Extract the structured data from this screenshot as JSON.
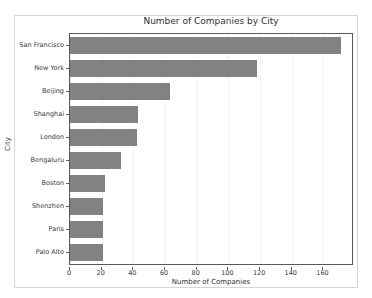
{
  "chart_data": {
    "type": "bar",
    "orientation": "horizontal",
    "title": "Number of Companies by City",
    "xlabel": "Number of Companies",
    "ylabel": "City",
    "categories": [
      "San Francisco",
      "New York",
      "Beijing",
      "Shanghai",
      "London",
      "Bengaluru",
      "Boston",
      "Shenzhen",
      "Paris",
      "Palo Alto"
    ],
    "values": [
      171,
      118,
      63,
      43,
      42,
      32,
      22,
      21,
      21,
      21
    ],
    "xlim": [
      0,
      178
    ],
    "xticks": [
      0,
      20,
      40,
      60,
      80,
      100,
      120,
      140,
      160
    ],
    "xtick_labels": [
      "0",
      "20",
      "40",
      "60",
      "80",
      "100",
      "120",
      "140",
      "160"
    ],
    "grid": true,
    "legend": null,
    "bar_color": "#828282",
    "axis_color": "#5a5a5a",
    "grid_color": "#f2f2f2",
    "figure_border_color": "#d6d6d6",
    "background": "#ffffff"
  }
}
